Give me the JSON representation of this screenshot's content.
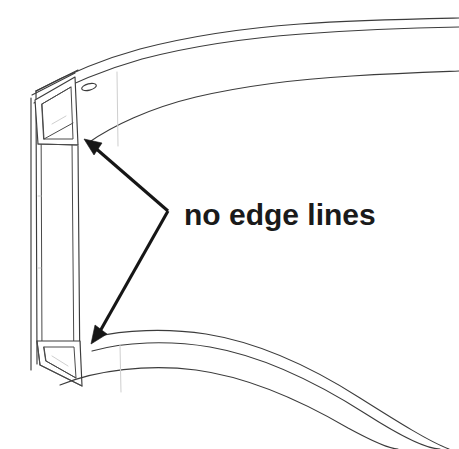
{
  "figure": {
    "kind": "cad-line-drawing",
    "background_color": "#ffffff",
    "line_color": "#3c3c3c",
    "annotation_color": "#161616",
    "width": 459,
    "height": 449
  },
  "annotations": {
    "callout_label": "no edge lines",
    "label_position": {
      "x": 184,
      "y": 225
    },
    "font_size_px": 30,
    "leader": {
      "vertex": {
        "x": 168,
        "y": 211
      },
      "targets": [
        {
          "name": "upper-edge-target",
          "x": 86,
          "y": 141
        },
        {
          "name": "lower-edge-target",
          "x": 92,
          "y": 341
        }
      ]
    }
  },
  "geometry": {
    "top_curves": [
      {
        "name": "top-outer-curve",
        "path": "M 35 91 C 90 56, 180 32, 280 24 C 340 20, 400 19, 459 18"
      },
      {
        "name": "top-middle-curve",
        "path": "M 33 101 C 92 66, 182 42, 282 33 C 342 29, 402 28, 459 27"
      },
      {
        "name": "top-inner-curve",
        "path": "M 88 143 C 140 109, 200 90, 290 80 C 350 74, 405 72, 459 71"
      }
    ],
    "bottom_curves": [
      {
        "name": "bottom-inner-curve",
        "path": "M 94 338 C 150 325, 215 327, 272 348 C 340 373, 400 410, 459 449"
      },
      {
        "name": "bottom-middle-curve",
        "path": "M 93 350 C 152 335, 218 339, 278 362 C 345 389, 405 427, 459 449"
      },
      {
        "name": "bottom-outer-curve",
        "path": "M 62 384 C 128 362, 200 365, 262 392 C 330 422, 385 445, 420 449"
      }
    ],
    "tube_ends": [
      {
        "name": "upper-tube-end",
        "x": 33,
        "y": 97,
        "width": 44,
        "height": 48
      },
      {
        "name": "lower-tube-end",
        "x": 38,
        "y": 340,
        "width": 44,
        "height": 48
      }
    ],
    "slot": {
      "name": "oval-slot",
      "cx": 89,
      "cy": 87,
      "rx": 7,
      "ry": 3,
      "rotation": -12
    }
  }
}
